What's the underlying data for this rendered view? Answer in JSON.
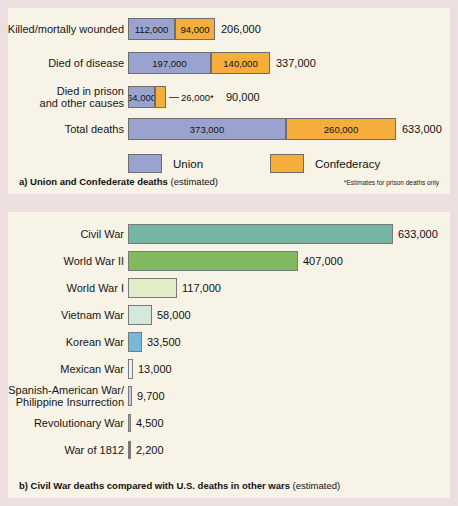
{
  "panel_a": {
    "caption_bold": "a) Union and Confederate deaths",
    "caption_rest": " (estimated)",
    "footnote": "*Estimates for prison deaths only",
    "legend": [
      {
        "label": "Union",
        "color": "#9aa3cf",
        "key": "union"
      },
      {
        "label": "Confederacy",
        "color": "#f5ad3c",
        "key": "conf"
      }
    ],
    "rows": [
      {
        "label": "Killed/mortally wounded",
        "union_label": "112,000",
        "conf_label": "94,000",
        "total_label": "206,000",
        "union": 112000,
        "confederacy": 94000,
        "total": 206000,
        "callout": false
      },
      {
        "label": "Died of disease",
        "union_label": "197,000",
        "conf_label": "140,000",
        "total_label": "337,000",
        "union": 197000,
        "confederacy": 140000,
        "total": 337000,
        "callout": false
      },
      {
        "label": "Died in prison\nand other causes",
        "union_label": "64,000",
        "conf_label": "26,000*",
        "total_label": "90,000",
        "union": 64000,
        "confederacy": 26000,
        "total": 90000,
        "callout": true
      },
      {
        "label": "Total deaths",
        "union_label": "373,000",
        "conf_label": "260,000",
        "total_label": "633,000",
        "union": 373000,
        "confederacy": 260000,
        "total": 633000,
        "callout": false
      }
    ]
  },
  "panel_b": {
    "caption_bold": "b) Civil War deaths compared with U.S. deaths in other wars",
    "caption_rest": " (estimated)",
    "rows": [
      {
        "label": "Civil War",
        "value": 633000,
        "value_label": "633,000",
        "color": "#74b5a4"
      },
      {
        "label": "World War II",
        "value": 407000,
        "value_label": "407,000",
        "color": "#82b860"
      },
      {
        "label": "World War I",
        "value": 117000,
        "value_label": "117,000",
        "color": "#e2eec7"
      },
      {
        "label": "Vietnam War",
        "value": 58000,
        "value_label": "58,000",
        "color": "#d4e8de"
      },
      {
        "label": "Korean War",
        "value": 33500,
        "value_label": "33,500",
        "color": "#79b6db"
      },
      {
        "label": "Mexican War",
        "value": 13000,
        "value_label": "13,000",
        "color": "#eef0f7"
      },
      {
        "label": "Spanish-American War/\nPhilippine Insurrection",
        "value": 9700,
        "value_label": "9,700",
        "color": "#c6c9e0"
      },
      {
        "label": "Revolutionary War",
        "value": 4500,
        "value_label": "4,500",
        "color": "#9aa0c0"
      },
      {
        "label": "War of 1812",
        "value": 2200,
        "value_label": "2,200",
        "color": "#6d7494"
      }
    ]
  },
  "chart_data": [
    {
      "type": "bar",
      "orientation": "horizontal",
      "stacked": true,
      "title": "a) Union and Confederate deaths (estimated)",
      "categories": [
        "Killed/mortally wounded",
        "Died of disease",
        "Died in prison and other causes",
        "Total deaths"
      ],
      "series": [
        {
          "name": "Union",
          "values": [
            112000,
            197000,
            64000,
            373000
          ],
          "color": "#9aa3cf"
        },
        {
          "name": "Confederacy",
          "values": [
            94000,
            140000,
            26000,
            260000
          ],
          "color": "#f5ad3c"
        }
      ],
      "totals": [
        206000,
        337000,
        90000,
        633000
      ],
      "xlabel": "",
      "ylabel": "",
      "grid": false,
      "legend": "bottom",
      "annotations": [
        "*Estimates for prison deaths only"
      ]
    },
    {
      "type": "bar",
      "orientation": "horizontal",
      "stacked": false,
      "title": "b) Civil War deaths compared with U.S. deaths in other wars (estimated)",
      "categories": [
        "Civil War",
        "World War II",
        "World War I",
        "Vietnam War",
        "Korean War",
        "Mexican War",
        "Spanish-American War/Philippine Insurrection",
        "Revolutionary War",
        "War of 1812"
      ],
      "values": [
        633000,
        407000,
        117000,
        58000,
        33500,
        13000,
        9700,
        4500,
        2200
      ],
      "xlabel": "",
      "ylabel": "",
      "xlim": [
        0,
        633000
      ],
      "grid": false,
      "legend": "none"
    }
  ]
}
